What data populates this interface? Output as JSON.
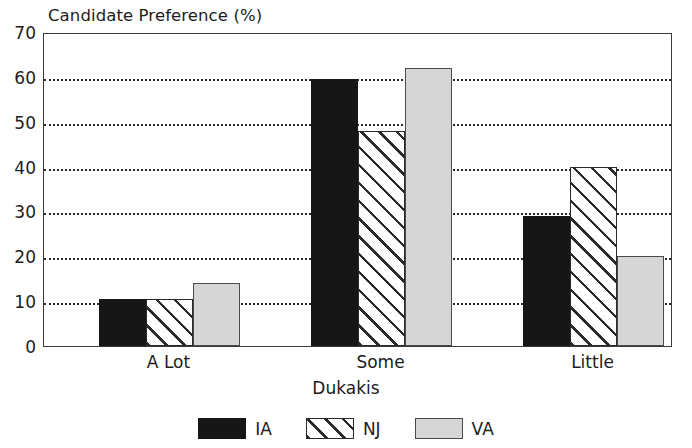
{
  "chart_data": {
    "type": "bar",
    "title": "Candidate Preference (%)",
    "xlabel": "Dukakis",
    "ylabel": "",
    "categories": [
      "A Lot",
      "Some",
      "Little"
    ],
    "series": [
      {
        "name": "IA",
        "values": [
          10.5,
          59.5,
          29
        ],
        "color": "#161616",
        "fill": "solid-black"
      },
      {
        "name": "NJ",
        "values": [
          10.5,
          48,
          40
        ],
        "color": "#2a2a2a",
        "fill": "diagonal-hatch"
      },
      {
        "name": "VA",
        "values": [
          14,
          62,
          20
        ],
        "color": "#d6d6d6",
        "fill": "light-gray"
      }
    ],
    "ylim": [
      0,
      70
    ],
    "yticks": [
      0,
      10,
      20,
      30,
      40,
      50,
      60,
      70
    ],
    "ytick_labels": [
      "0",
      "10",
      "20",
      "30",
      "40",
      "50",
      "60",
      "70"
    ],
    "grid": true,
    "grid_style": "dotted-horizontal",
    "legend_position": "bottom-center",
    "frame": true
  },
  "legend": {
    "entries": [
      {
        "label": "IA"
      },
      {
        "label": "NJ"
      },
      {
        "label": "VA"
      }
    ]
  }
}
